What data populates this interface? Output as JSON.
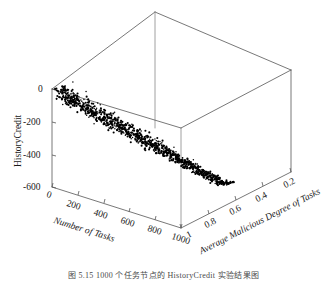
{
  "figure": {
    "caption": "图 5.15   1000 个任务节点的 HistoryCredit 实验结果图"
  },
  "chart_data": {
    "type": "scatter",
    "projection": "3d",
    "title": "",
    "xlabel": "Number of Tasks",
    "ylabel": "HistoryCredit",
    "zlabel": "Average Malicious Degree of Tasks",
    "xticks": [
      "0",
      "200",
      "400",
      "600",
      "800",
      "1000"
    ],
    "yticks": [
      "0",
      "-200",
      "-400",
      "-600"
    ],
    "zticks": [
      "1",
      "0.8",
      "0.6",
      "0.4",
      "0.2"
    ],
    "xlim": [
      0,
      1000
    ],
    "ylim": [
      -600,
      0
    ],
    "zlim": [
      1,
      0.2
    ],
    "grid": false,
    "legend": null,
    "marker": "dot",
    "marker_color": "#000000",
    "n_points": 1000,
    "points": [
      [
        30,
        0.97,
        -18
      ],
      [
        42,
        0.96,
        -26
      ],
      [
        38,
        0.98,
        -12
      ],
      [
        55,
        0.95,
        -35
      ],
      [
        48,
        0.93,
        -44
      ],
      [
        62,
        0.97,
        -28
      ],
      [
        70,
        0.94,
        -52
      ],
      [
        58,
        0.99,
        -20
      ],
      [
        75,
        0.92,
        -61
      ],
      [
        66,
        0.96,
        -40
      ],
      [
        84,
        0.95,
        -70
      ],
      [
        92,
        0.93,
        -58
      ],
      [
        80,
        0.98,
        -33
      ],
      [
        99,
        0.91,
        -82
      ],
      [
        88,
        0.94,
        -66
      ],
      [
        105,
        0.96,
        -47
      ],
      [
        112,
        0.92,
        -90
      ],
      [
        120,
        0.9,
        -103
      ],
      [
        108,
        0.95,
        -72
      ],
      [
        128,
        0.93,
        -85
      ],
      [
        135,
        0.89,
        -112
      ],
      [
        118,
        0.97,
        -55
      ],
      [
        142,
        0.91,
        -98
      ],
      [
        150,
        0.88,
        -125
      ],
      [
        132,
        0.94,
        -78
      ],
      [
        158,
        0.9,
        -118
      ],
      [
        165,
        0.87,
        -136
      ],
      [
        148,
        0.92,
        -106
      ],
      [
        172,
        0.89,
        -129
      ],
      [
        180,
        0.86,
        -148
      ],
      [
        162,
        0.91,
        -115
      ],
      [
        188,
        0.88,
        -141
      ],
      [
        196,
        0.85,
        -158
      ],
      [
        175,
        0.9,
        -133
      ],
      [
        204,
        0.87,
        -152
      ],
      [
        212,
        0.84,
        -170
      ],
      [
        192,
        0.89,
        -145
      ],
      [
        220,
        0.86,
        -164
      ],
      [
        228,
        0.83,
        -182
      ],
      [
        208,
        0.88,
        -157
      ],
      [
        236,
        0.85,
        -176
      ],
      [
        244,
        0.82,
        -194
      ],
      [
        225,
        0.87,
        -169
      ],
      [
        252,
        0.84,
        -188
      ],
      [
        260,
        0.81,
        -206
      ],
      [
        240,
        0.86,
        -181
      ],
      [
        268,
        0.83,
        -200
      ],
      [
        276,
        0.8,
        -218
      ],
      [
        256,
        0.85,
        -193
      ],
      [
        284,
        0.82,
        -212
      ],
      [
        292,
        0.79,
        -230
      ],
      [
        272,
        0.84,
        -205
      ],
      [
        300,
        0.81,
        -224
      ],
      [
        308,
        0.78,
        -242
      ],
      [
        288,
        0.83,
        -217
      ],
      [
        316,
        0.8,
        -236
      ],
      [
        324,
        0.77,
        -254
      ],
      [
        304,
        0.82,
        -229
      ],
      [
        332,
        0.79,
        -248
      ],
      [
        340,
        0.76,
        -266
      ],
      [
        320,
        0.81,
        -241
      ],
      [
        348,
        0.78,
        -260
      ],
      [
        356,
        0.75,
        -278
      ],
      [
        336,
        0.8,
        -253
      ],
      [
        364,
        0.77,
        -272
      ],
      [
        372,
        0.74,
        -290
      ],
      [
        352,
        0.79,
        -265
      ],
      [
        380,
        0.76,
        -284
      ],
      [
        388,
        0.73,
        -302
      ],
      [
        368,
        0.78,
        -277
      ],
      [
        396,
        0.75,
        -296
      ],
      [
        404,
        0.72,
        -314
      ],
      [
        384,
        0.77,
        -289
      ],
      [
        412,
        0.74,
        -308
      ],
      [
        420,
        0.71,
        -326
      ],
      [
        400,
        0.76,
        -301
      ],
      [
        428,
        0.73,
        -320
      ],
      [
        436,
        0.7,
        -338
      ],
      [
        416,
        0.75,
        -313
      ],
      [
        444,
        0.72,
        -332
      ],
      [
        452,
        0.69,
        -350
      ],
      [
        432,
        0.74,
        -325
      ],
      [
        460,
        0.71,
        -344
      ],
      [
        468,
        0.68,
        -362
      ],
      [
        448,
        0.73,
        -337
      ],
      [
        476,
        0.7,
        -356
      ],
      [
        484,
        0.67,
        -374
      ],
      [
        464,
        0.72,
        -349
      ],
      [
        492,
        0.69,
        -368
      ],
      [
        500,
        0.66,
        -386
      ],
      [
        480,
        0.71,
        -361
      ],
      [
        508,
        0.68,
        -380
      ],
      [
        516,
        0.65,
        -398
      ],
      [
        496,
        0.7,
        -373
      ],
      [
        524,
        0.67,
        -392
      ],
      [
        532,
        0.64,
        -410
      ],
      [
        512,
        0.69,
        -385
      ],
      [
        540,
        0.66,
        -404
      ],
      [
        548,
        0.63,
        -422
      ],
      [
        528,
        0.68,
        -397
      ],
      [
        556,
        0.65,
        -416
      ],
      [
        564,
        0.62,
        -434
      ],
      [
        544,
        0.67,
        -409
      ],
      [
        572,
        0.64,
        -428
      ],
      [
        580,
        0.61,
        -446
      ],
      [
        560,
        0.66,
        -421
      ],
      [
        588,
        0.63,
        -440
      ],
      [
        596,
        0.6,
        -458
      ],
      [
        576,
        0.65,
        -433
      ],
      [
        604,
        0.62,
        -452
      ],
      [
        612,
        0.59,
        -470
      ],
      [
        592,
        0.64,
        -445
      ],
      [
        620,
        0.61,
        -464
      ],
      [
        628,
        0.58,
        -482
      ],
      [
        608,
        0.63,
        -457
      ],
      [
        636,
        0.6,
        -476
      ],
      [
        644,
        0.57,
        -494
      ],
      [
        624,
        0.62,
        -469
      ],
      [
        652,
        0.59,
        -488
      ],
      [
        660,
        0.56,
        -506
      ],
      [
        640,
        0.61,
        -481
      ],
      [
        668,
        0.58,
        -500
      ],
      [
        676,
        0.55,
        -518
      ],
      [
        656,
        0.6,
        -493
      ],
      [
        684,
        0.57,
        -512
      ],
      [
        692,
        0.54,
        -530
      ],
      [
        672,
        0.59,
        -505
      ],
      [
        700,
        0.56,
        -524
      ],
      [
        708,
        0.53,
        -542
      ],
      [
        688,
        0.58,
        -517
      ],
      [
        716,
        0.55,
        -536
      ],
      [
        724,
        0.52,
        -554
      ],
      [
        704,
        0.57,
        -529
      ],
      [
        732,
        0.54,
        -548
      ],
      [
        740,
        0.51,
        -566
      ],
      [
        720,
        0.56,
        -541
      ],
      [
        748,
        0.53,
        -560
      ],
      [
        756,
        0.5,
        -578
      ],
      [
        736,
        0.55,
        -553
      ],
      [
        764,
        0.52,
        -572
      ],
      [
        772,
        0.49,
        -590
      ],
      [
        752,
        0.54,
        -565
      ],
      [
        780,
        0.51,
        -584
      ],
      [
        788,
        0.48,
        -596
      ],
      [
        768,
        0.53,
        -577
      ],
      [
        796,
        0.5,
        -592
      ],
      [
        804,
        0.47,
        -600
      ],
      [
        784,
        0.52,
        -586
      ],
      [
        812,
        0.49,
        -598
      ],
      [
        820,
        0.46,
        -600
      ]
    ]
  },
  "axes": {
    "x": {
      "title": "Number of Tasks",
      "ticks": [
        {
          "label": "0",
          "x": 48,
          "y": 190
        },
        {
          "label": "200",
          "x": 68,
          "y": 199
        },
        {
          "label": "400",
          "x": 95,
          "y": 208
        },
        {
          "label": "600",
          "x": 122,
          "y": 216
        },
        {
          "label": "800",
          "x": 149,
          "y": 224
        },
        {
          "label": "1000",
          "x": 173,
          "y": 232
        }
      ],
      "title_pos": {
        "x": 55,
        "y": 214
      }
    },
    "y": {
      "title": "HistoryCredit",
      "ticks": [
        {
          "label": "0",
          "x": 38,
          "y": 85
        },
        {
          "label": "-200",
          "x": 23,
          "y": 118
        },
        {
          "label": "-400",
          "x": 23,
          "y": 151
        },
        {
          "label": "-600",
          "x": 23,
          "y": 183
        }
      ],
      "title_pos": {
        "x": 14,
        "y": 167
      }
    },
    "z": {
      "title": "Average Malicious Degree of Tasks",
      "ticks": [
        {
          "label": "1",
          "x": 185,
          "y": 232
        },
        {
          "label": "0.8",
          "x": 203,
          "y": 221
        },
        {
          "label": "0.6",
          "x": 228,
          "y": 208
        },
        {
          "label": "0.4",
          "x": 253,
          "y": 195
        },
        {
          "label": "0.2",
          "x": 281,
          "y": 181
        }
      ],
      "title_pos": {
        "x": 197,
        "y": 245
      }
    }
  },
  "geometry": {
    "v": {
      "back_top": [
        155,
        12
      ],
      "left_top": [
        52,
        89
      ],
      "right_top": [
        291,
        70
      ],
      "front_top": [
        181,
        128
      ],
      "left_bot": [
        52,
        187
      ],
      "front_bot": [
        181,
        228
      ],
      "right_bot": [
        291,
        172
      ]
    },
    "axis_color": "#555555",
    "line_width": 0.8
  }
}
